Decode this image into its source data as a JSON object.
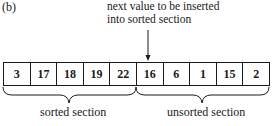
{
  "panel_label": "(b)",
  "callout": {
    "line1": "next value to be inserted",
    "line2": "into sorted section"
  },
  "array": {
    "values": [
      "3",
      "17",
      "18",
      "19",
      "22",
      "16",
      "6",
      "1",
      "15",
      "2"
    ],
    "sorted_count": 5,
    "next_index": 5
  },
  "sections": {
    "sorted_label": "sorted section",
    "unsorted_label": "unsorted section"
  },
  "icons": {
    "arrow": "down-arrow-icon",
    "brace": "curly-brace-icon"
  }
}
